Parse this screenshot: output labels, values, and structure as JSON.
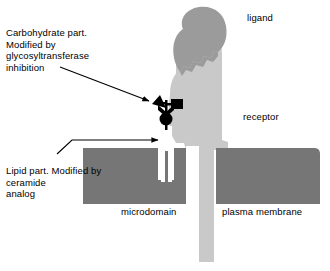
{
  "figure": {
    "kind": "biology-schematic-diagram",
    "width": 330,
    "height": 271,
    "background_color": "#ffffff"
  },
  "annotations": {
    "carbohydrate_note": "Carbohydrate part.\nModified by\nglycosyltransferase\ninhibition",
    "lipid_note": "Lipid part. Modified by\nceramide\nanalog"
  },
  "labels": {
    "ligand": "ligand",
    "receptor": "receptor",
    "microdomain": "microdomain",
    "plasma_membrane": "plasma membrane"
  },
  "colors": {
    "ligand_fill": "#9b9b9b",
    "receptor_fill": "#c9c9c9",
    "membrane_fill": "#767676",
    "glycolipid_black": "#000000",
    "arrow_stroke": "#000000",
    "text": "#000000",
    "background": "#ffffff"
  },
  "parts": {
    "ligand_shape": "rounded-blob",
    "receptor_shape": "transmembrane-protein",
    "microdomain_block": "lipid-raft-membrane-block",
    "plasma_membrane_block": "membrane-block",
    "glycolipid": {
      "sugar_triangle": "triangle-glyph",
      "sugar_square": "square-glyph",
      "sugar_chevron": "chevron-glyph",
      "ceramide_circle": "circle-glyph",
      "lipid_tails": "two-acyl-chains"
    }
  },
  "arrows": [
    {
      "name": "carbohydrate-arrow",
      "from": "carbohydrate note",
      "to": "glycolipid head group"
    },
    {
      "name": "lipid-arrow",
      "from": "lipid note",
      "to": "lipid tails in microdomain"
    }
  ]
}
